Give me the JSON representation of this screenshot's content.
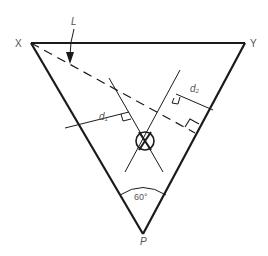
{
  "diagram": {
    "type": "geometry",
    "labels": {
      "vertex_x": "X",
      "vertex_y": "Y",
      "vertex_p": "P",
      "line_l": "L",
      "dist_1": "d",
      "dist_1_sub": "1",
      "dist_2": "d",
      "dist_2_sub": "2",
      "angle": "60°"
    },
    "colors": {
      "stroke": "#1a1a1a",
      "label": "#555555"
    }
  }
}
